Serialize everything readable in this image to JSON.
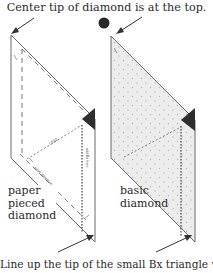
{
  "diagram": {
    "top_caption": "Center tip of diamond is at the top.",
    "bottom_caption": "Line up the tip of the small Bx triangle with",
    "left_diamond": {
      "label_lines": [
        "paper",
        "pieced",
        "diamond"
      ],
      "inner_labels": [
        "LE22",
        "add Bx here",
        "seam allowance"
      ]
    },
    "right_diamond": {
      "label_lines": [
        "basic",
        "diamond"
      ]
    },
    "colors": {
      "outline": "#6a6a6a",
      "fill_basic": "#e8e8e8",
      "triangle_bx": "#2e2e2e",
      "dot": "#3a3a3a"
    }
  }
}
